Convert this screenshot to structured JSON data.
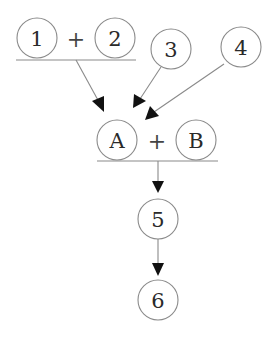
{
  "diagram": {
    "type": "flow",
    "nodes": [
      {
        "id": "1",
        "label": "1"
      },
      {
        "id": "2",
        "label": "2"
      },
      {
        "id": "3",
        "label": "3"
      },
      {
        "id": "4",
        "label": "4"
      },
      {
        "id": "A",
        "label": "A"
      },
      {
        "id": "B",
        "label": "B"
      },
      {
        "id": "5",
        "label": "5"
      },
      {
        "id": "6",
        "label": "6"
      }
    ],
    "operators": {
      "top_combine": "+",
      "mid_combine": "+"
    },
    "groups": [
      {
        "id": "group-1-2",
        "members": [
          "1",
          "2"
        ],
        "operator": "+"
      },
      {
        "id": "group-A-B",
        "members": [
          "A",
          "B"
        ],
        "operator": "+"
      }
    ],
    "edges": [
      {
        "from": "group-1-2",
        "to": "group-A-B"
      },
      {
        "from": "3",
        "to": "group-A-B"
      },
      {
        "from": "4",
        "to": "group-A-B"
      },
      {
        "from": "group-A-B",
        "to": "5"
      },
      {
        "from": "5",
        "to": "6"
      }
    ],
    "colors": {
      "stroke": "#8a8a8a",
      "arrowhead": "#111111",
      "text": "#2a2a2a",
      "background": "#ffffff"
    }
  }
}
